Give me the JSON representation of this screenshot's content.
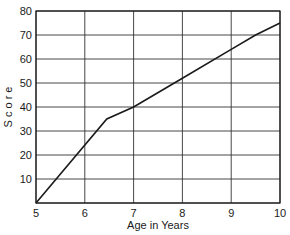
{
  "chart_data": {
    "type": "line",
    "title": "",
    "xlabel": "Age in Years",
    "ylabel": "S c o r e",
    "xlim": [
      5,
      10
    ],
    "ylim": [
      0,
      80
    ],
    "xticks": [
      5,
      6,
      7,
      8,
      9,
      10
    ],
    "yticks": [
      0,
      10,
      20,
      30,
      40,
      50,
      60,
      70,
      80
    ],
    "ytick_labels": [
      "",
      "10",
      "20",
      "30",
      "40",
      "50",
      "60",
      "70",
      "80"
    ],
    "grid": true,
    "legend": null,
    "series": [
      {
        "name": "Score",
        "x": [
          5,
          6.45,
          7,
          8,
          9,
          9.5,
          10
        ],
        "y": [
          0,
          35,
          40,
          52,
          64,
          70,
          75
        ]
      }
    ]
  },
  "colors": {
    "line": "#1a1a1a",
    "grid": "#333333",
    "background": "#ffffff"
  }
}
